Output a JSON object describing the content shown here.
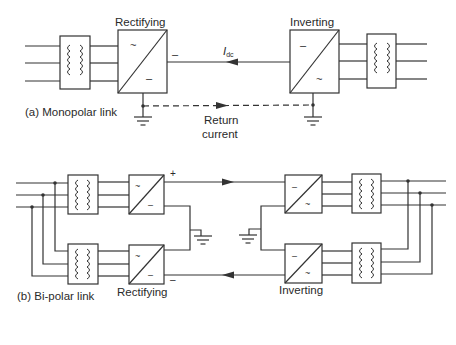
{
  "diagram": {
    "type": "HVDC link configurations",
    "panels": [
      {
        "id": "a",
        "caption": "(a) Monopolar link",
        "rectifier_label": "Rectifying",
        "inverter_label": "Inverting",
        "current_label_main": "I",
        "current_label_sub": "dc",
        "return_label_line1": "Return",
        "return_label_line2": "current",
        "rectifier_symbols": {
          "ac": "~",
          "dc": "–"
        },
        "inverter_symbols": {
          "dc": "–",
          "ac": "~"
        },
        "dc_terminal_sign": "–"
      },
      {
        "id": "b",
        "caption": "(b) Bi-polar link",
        "rectifier_label": "Rectifying",
        "inverter_label": "Inverting",
        "positive_sign": "+",
        "negative_sign": "–",
        "converter_symbols": {
          "ac": "~",
          "dc": "–"
        }
      }
    ]
  }
}
